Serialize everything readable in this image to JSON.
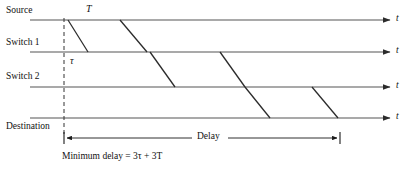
{
  "figure": {
    "type": "timing-diagram",
    "width": 410,
    "height": 171,
    "background": "#ffffff",
    "line_color": "#4a4a4a",
    "diagonal_color": "#2b2b2b",
    "text_color": "#111111"
  },
  "axes": [
    {
      "id": "source",
      "label": "Source",
      "y": 20,
      "label_x": 6,
      "label_y": 6,
      "t_label": "t"
    },
    {
      "id": "switch1",
      "label": "Switch 1",
      "y": 52,
      "label_x": 6,
      "label_y": 38,
      "t_label": "t"
    },
    {
      "id": "switch2",
      "label": "Switch 2",
      "y": 87,
      "label_x": 6,
      "label_y": 72,
      "t_label": "t"
    },
    {
      "id": "destination",
      "label": "Destination",
      "y": 118,
      "label_x": 6,
      "label_y": 122,
      "t_label": "t"
    }
  ],
  "symbols": {
    "transmission_time": "T",
    "propagation_delay": "τ"
  },
  "symbol_positions": {
    "T": {
      "x": 86,
      "y": 4
    },
    "tau": {
      "x": 70,
      "y": 56
    }
  },
  "packets": [
    {
      "id": "packet-1",
      "hops": [
        {
          "from_axis": "source",
          "to_axis": "switch1",
          "x1": 68,
          "x2": 88
        },
        {
          "from_axis": "switch1",
          "to_axis": "switch2",
          "x1": 150,
          "x2": 175
        },
        {
          "from_axis": "switch2",
          "to_axis": "destination",
          "x1": 245,
          "x2": 270
        }
      ]
    },
    {
      "id": "packet-2",
      "hops": [
        {
          "from_axis": "source",
          "to_axis": "switch1",
          "x1": 120,
          "x2": 147
        },
        {
          "from_axis": "switch1",
          "to_axis": "switch2",
          "x1": 220,
          "x2": 245
        },
        {
          "from_axis": "switch2",
          "to_axis": "destination",
          "x1": 312,
          "x2": 338
        }
      ]
    }
  ],
  "delay_measure": {
    "label": "Delay",
    "label_x": 196,
    "y": 138,
    "x_start": 64,
    "x_end": 340,
    "caption": "Minimum delay = 3τ + 3T",
    "caption_x": 62,
    "caption_y": 152
  },
  "dashed_guide": {
    "x": 64,
    "y_top": 20,
    "y_bottom": 134
  },
  "arrow_end_x": 392,
  "t_label_x": 396
}
